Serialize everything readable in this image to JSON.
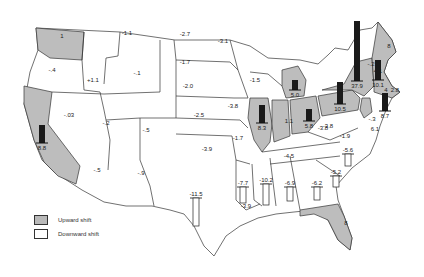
{
  "legend": {
    "upward_label": "Upward shift",
    "downward_label": "Downward shift"
  },
  "colors": {
    "upward": "#bdbdbd",
    "downward": "#ffffff",
    "bar": "#1a1a1a"
  },
  "states": [
    {
      "id": "WA",
      "value": "1",
      "shift": "up",
      "lx": 62,
      "ly": 38
    },
    {
      "id": "OR",
      "value": "-.4",
      "shift": "down",
      "lx": 52,
      "ly": 72
    },
    {
      "id": "CA",
      "value": "8.8",
      "shift": "up",
      "lx": 42,
      "ly": 150,
      "bar": {
        "h": 18,
        "dir": "up"
      }
    },
    {
      "id": "ID",
      "value": "+1.1",
      "shift": "down",
      "lx": 93,
      "ly": 82
    },
    {
      "id": "NV",
      "value": "-.03",
      "shift": "down",
      "lx": 69,
      "ly": 117
    },
    {
      "id": "MT",
      "value": "-1.1",
      "shift": "down",
      "lx": 127,
      "ly": 35
    },
    {
      "id": "WY",
      "value": "-.1",
      "shift": "down",
      "lx": 137,
      "ly": 75
    },
    {
      "id": "UT",
      "value": "-.2",
      "shift": "down",
      "lx": 106,
      "ly": 125
    },
    {
      "id": "CO",
      "value": "-.5",
      "shift": "down",
      "lx": 146,
      "ly": 132
    },
    {
      "id": "AZ",
      "value": "-.5",
      "shift": "down",
      "lx": 97,
      "ly": 172
    },
    {
      "id": "NM",
      "value": "-.9",
      "shift": "down",
      "lx": 141,
      "ly": 175
    },
    {
      "id": "ND",
      "value": "-2.7",
      "shift": "down",
      "lx": 185,
      "ly": 36
    },
    {
      "id": "SD",
      "value": "-1.7",
      "shift": "down",
      "lx": 185,
      "ly": 64
    },
    {
      "id": "NE",
      "value": "-2.0",
      "shift": "down",
      "lx": 188,
      "ly": 88
    },
    {
      "id": "KS",
      "value": "-2.5",
      "shift": "down",
      "lx": 199,
      "ly": 117
    },
    {
      "id": "OK",
      "value": "-3.9",
      "shift": "down",
      "lx": 207,
      "ly": 151
    },
    {
      "id": "TX",
      "value": "-11.5",
      "shift": "down",
      "lx": 196,
      "ly": 196,
      "bar": {
        "h": 28,
        "dir": "down"
      }
    },
    {
      "id": "MN",
      "value": "-3.1",
      "shift": "down",
      "lx": 223,
      "ly": 43
    },
    {
      "id": "IA",
      "value": "-3.8",
      "shift": "down",
      "lx": 233,
      "ly": 108
    },
    {
      "id": "MO",
      "value": "-1.7",
      "shift": "down",
      "lx": 238,
      "ly": 140
    },
    {
      "id": "AR",
      "value": "-7.7",
      "shift": "down",
      "lx": 243,
      "ly": 185,
      "bar": {
        "h": 16,
        "dir": "down"
      }
    },
    {
      "id": "LA",
      "value": "-3.9",
      "shift": "down",
      "lx": 246,
      "ly": 208
    },
    {
      "id": "WI",
      "value": "-1.5",
      "shift": "down",
      "lx": 255,
      "ly": 82
    },
    {
      "id": "IL",
      "value": "8.3",
      "shift": "up",
      "lx": 262,
      "ly": 130,
      "bar": {
        "h": 18,
        "dir": "up"
      }
    },
    {
      "id": "MI",
      "value": "5.0",
      "shift": "up",
      "lx": 295,
      "ly": 97,
      "bar": {
        "h": 10,
        "dir": "up"
      }
    },
    {
      "id": "IN",
      "value": "1.1",
      "shift": "up",
      "lx": 289,
      "ly": 123
    },
    {
      "id": "OH",
      "value": "5.8",
      "shift": "up",
      "lx": 309,
      "ly": 128,
      "bar": {
        "h": 12,
        "dir": "up"
      }
    },
    {
      "id": "KY",
      "value": "-3.8",
      "shift": "down",
      "lx": 323,
      "ly": 130
    },
    {
      "id": "TN",
      "value": "-4.5",
      "shift": "down",
      "lx": 289,
      "ly": 158
    },
    {
      "id": "MS",
      "value": "-10.2",
      "shift": "down",
      "lx": 266,
      "ly": 182,
      "bar": {
        "h": 21,
        "dir": "down"
      }
    },
    {
      "id": "AL",
      "value": "-6.9",
      "shift": "down",
      "lx": 290,
      "ly": 185,
      "bar": {
        "h": 14,
        "dir": "down"
      }
    },
    {
      "id": "GA",
      "value": "-6.2",
      "shift": "down",
      "lx": 317,
      "ly": 185,
      "bar": {
        "h": 13,
        "dir": "down"
      }
    },
    {
      "id": "FL",
      "value": "8",
      "shift": "up",
      "lx": 346,
      "ly": 225
    },
    {
      "id": "SC",
      "value": "-5.2",
      "shift": "down",
      "lx": 336,
      "ly": 174,
      "bar": {
        "h": 11,
        "dir": "down"
      }
    },
    {
      "id": "NC",
      "value": "-5.6",
      "shift": "down",
      "lx": 348,
      "ly": 152,
      "bar": {
        "h": 12,
        "dir": "down"
      }
    },
    {
      "id": "VA",
      "value": "-1.9",
      "shift": "down",
      "lx": 345,
      "ly": 138
    },
    {
      "id": "WV",
      "value": "-3.8",
      "shift": "down",
      "lx": 328,
      "ly": 128
    },
    {
      "id": "PA",
      "value": "10.5",
      "shift": "up",
      "lx": 340,
      "ly": 111,
      "bar": {
        "h": 22,
        "dir": "up"
      }
    },
    {
      "id": "NY",
      "value": "37.9",
      "shift": "up",
      "lx": 357,
      "ly": 88,
      "bar": {
        "h": 60,
        "dir": "up"
      }
    },
    {
      "id": "NJ",
      "value": "8.7",
      "shift": "up",
      "lx": 385,
      "ly": 118,
      "bar": {
        "h": 18,
        "dir": "up"
      }
    },
    {
      "id": "MD",
      "value": "-.3",
      "shift": "down",
      "lx": 372,
      "ly": 121
    },
    {
      "id": "DE",
      "value": "6.1",
      "shift": "up",
      "lx": 375,
      "ly": 131
    },
    {
      "id": "VT",
      "value": "-.2",
      "shift": "down",
      "lx": 371,
      "ly": 66
    },
    {
      "id": "NH",
      "value": "4.1",
      "shift": "up",
      "lx": 378,
      "ly": 73
    },
    {
      "id": "MA",
      "value": "10.1",
      "shift": "up",
      "lx": 378,
      "ly": 87,
      "bar": {
        "h": 20,
        "dir": "up"
      }
    },
    {
      "id": "CT",
      "value": "4",
      "shift": "up",
      "lx": 386,
      "ly": 92
    },
    {
      "id": "RI",
      "value": "2.8",
      "shift": "up",
      "lx": 395,
      "ly": 92
    },
    {
      "id": "ME",
      "value": "8",
      "shift": "up",
      "lx": 389,
      "ly": 48
    }
  ]
}
